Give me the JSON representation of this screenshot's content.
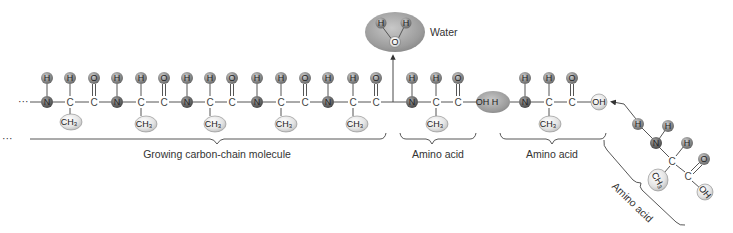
{
  "labels": {
    "water": "Water",
    "growing_chain": "Growing carbon-chain molecule",
    "amino_acid_1": "Amino acid",
    "amino_acid_2": "Amino acid",
    "amino_acid_3": "Amino acid",
    "ellipsis_left": "···",
    "ellipsis_bracket": "···"
  },
  "atoms": {
    "H": "H",
    "O": "O",
    "N": "N",
    "C": "C",
    "CH3": "CH",
    "CH3_sub": "3",
    "OH": "OH",
    "OH_H": "OH H"
  },
  "colors": {
    "n_atom": "#6e6e6e",
    "h_o_atom": "#8a8a8a",
    "ch3": "#e2e2e2",
    "water_ellipse": "#9a9a9a",
    "removed_oh_h": "#8e8e8e",
    "text": "#333333"
  }
}
